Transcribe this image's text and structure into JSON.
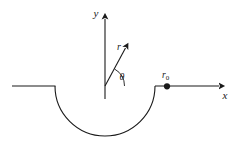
{
  "figure": {
    "background_color": "#ffffff",
    "stroke_color": "#1a1a1a",
    "labels": {
      "y_axis": "y",
      "x_axis": "x",
      "radial_vector": "r",
      "angle": "θ",
      "source_point": "r",
      "source_point_subscript": "0"
    },
    "geometry": {
      "origin": {
        "x": 105,
        "y": 86
      },
      "semicircle_radius": 50,
      "semicircle_start_angle_deg": 0,
      "semicircle_end_angle_deg": 180,
      "semicircle_orientation": "below-axis",
      "left_plane_line": {
        "x1": 12,
        "y1": 86,
        "x2": 55,
        "y2": 86
      },
      "right_plane_line": {
        "x1": 155,
        "y1": 86,
        "x2": 227,
        "y2": 86
      },
      "y_axis_line": {
        "x1": 105,
        "y1": 12,
        "x2": 105,
        "y2": 99
      },
      "radial_arrow": {
        "x1": 105,
        "y1": 86,
        "x2": 128,
        "y2": 43
      },
      "angle_arc_radius": 20,
      "point_r0": {
        "x": 167,
        "y": 86,
        "dot_radius": 3
      }
    }
  }
}
